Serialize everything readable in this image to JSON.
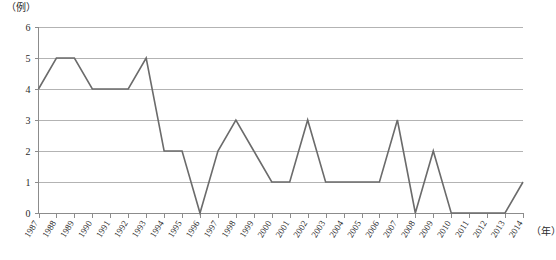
{
  "chart_data": {
    "type": "line",
    "title": "",
    "subtitle": "",
    "xlabel": "（年）",
    "ylabel": "（例）",
    "ylim": [
      0,
      6
    ],
    "ytick_values": [
      0,
      1,
      2,
      3,
      4,
      5,
      6
    ],
    "ytick_labels": [
      "0",
      "1",
      "2",
      "3",
      "4",
      "5",
      "6"
    ],
    "grid": true,
    "grid_axis": "y",
    "legend": false,
    "legend_position": "none",
    "annotations": [],
    "categories": [
      "1987",
      "1988",
      "1989",
      "1990",
      "1991",
      "1992",
      "1993",
      "1994",
      "1995",
      "1996",
      "1997",
      "1998",
      "1999",
      "2000",
      "2001",
      "2002",
      "2003",
      "2004",
      "2005",
      "2006",
      "2007",
      "2008",
      "2009",
      "2010",
      "2011",
      "2012",
      "2013",
      "2014"
    ],
    "values": [
      4,
      5,
      5,
      4,
      4,
      4,
      5,
      2,
      2,
      0,
      2,
      3,
      2,
      1,
      1,
      3,
      1,
      1,
      1,
      1,
      3,
      0,
      2,
      0,
      0,
      0,
      0,
      1
    ],
    "series": [
      {
        "name": "",
        "color": "#6b6b6b",
        "values": [
          4,
          5,
          5,
          4,
          4,
          4,
          5,
          2,
          2,
          0,
          2,
          3,
          2,
          1,
          1,
          3,
          1,
          1,
          1,
          1,
          3,
          0,
          2,
          0,
          0,
          0,
          0,
          1
        ]
      }
    ]
  },
  "style": {
    "line_color": "#6b6b6b",
    "grid_color": "#b3b3b3",
    "axis_color": "#8c8c8c",
    "text_color": "#2a2a2a",
    "background": "#ffffff"
  }
}
